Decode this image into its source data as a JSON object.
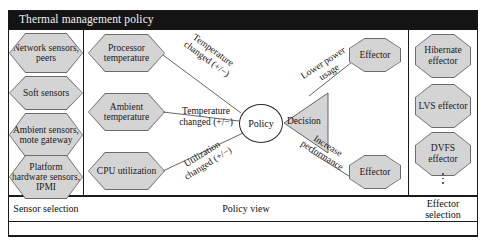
{
  "figure": {
    "title": "Thermal management policy",
    "colors": {
      "title_bar": "#141414",
      "title_text": "#f2f2f2",
      "shape_fill": "#d4d4d4",
      "shape_stroke": "#6b6b6b",
      "frame": "#1a1a1a",
      "page": "#ffffff"
    }
  },
  "sensor_selection": {
    "caption": "Sensor selection",
    "items": [
      {
        "label": "Network sensors, peers"
      },
      {
        "label": "Soft sensors"
      },
      {
        "label": "Ambient sensors, mote gateway"
      },
      {
        "label": "Platform hardware sensors, IPMI"
      }
    ]
  },
  "policy_view": {
    "caption": "Policy view",
    "sensor_nodes": [
      {
        "label": "Processor temperature"
      },
      {
        "label": "Ambient temperature"
      },
      {
        "label": "CPU utilization"
      }
    ],
    "policy_node": {
      "label": "Policy"
    },
    "decision_node": {
      "label": "Decision"
    },
    "effector_nodes": [
      {
        "label": "Effector"
      },
      {
        "label": "Effector"
      }
    ],
    "input_edges": [
      {
        "line1": "Temperature",
        "line2": "changed (+/−)"
      },
      {
        "line1": "Temperature",
        "line2": "changed (+/−)"
      },
      {
        "line1": "Utilization",
        "line2": "changed (+/−)"
      }
    ],
    "output_edges": [
      {
        "line1": "Lower power",
        "line2": "usage"
      },
      {
        "line1": "Increase",
        "line2": "performance"
      }
    ]
  },
  "effector_selection": {
    "caption": "Effector selection",
    "items": [
      {
        "label": "Hibernate effector"
      },
      {
        "label": "LVS effector"
      },
      {
        "label": "DVFS effector"
      }
    ],
    "ellipsis": "⋮"
  }
}
